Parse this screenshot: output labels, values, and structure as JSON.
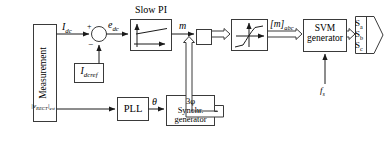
{
  "diagram": {
    "type": "control-block-diagram",
    "background": "#ffffff",
    "line_color": "#000000",
    "bus_fill": "#ffffff"
  },
  "blocks": {
    "measurement": {
      "label": "Measurement",
      "orientation": "vertical"
    },
    "idcref": {
      "label": "I",
      "sub": "dcref"
    },
    "slow_pi": {
      "caption": "Slow PI",
      "plot": "ramp"
    },
    "pll": {
      "label": "PLL"
    },
    "synchr": {
      "line1": "3φ",
      "line2": "Synchr.",
      "line3": "generator"
    },
    "multiplier": {
      "label": ""
    },
    "saturation": {
      "plot": "s-curve"
    },
    "svm": {
      "line1": "SVM",
      "line2": "generator"
    },
    "output_arrow": {
      "line1": "S",
      "sub1": "a",
      "line2": "S",
      "sub2": "b",
      "line3": "S",
      "sub3": "c"
    }
  },
  "signals": {
    "idc": {
      "main": "I",
      "sub": "dc"
    },
    "vrect": {
      "pre": "|v",
      "sub": "RECT",
      "post": "|",
      "sub2": "est"
    },
    "edc": {
      "main": "e",
      "sub": "dc"
    },
    "m": {
      "main": "m"
    },
    "m_abc": {
      "pre": "[m]",
      "sub": "abc"
    },
    "theta": {
      "main": "θ"
    },
    "fs": {
      "main": "f",
      "sub": "s"
    },
    "plus": "+",
    "minus": "−"
  }
}
